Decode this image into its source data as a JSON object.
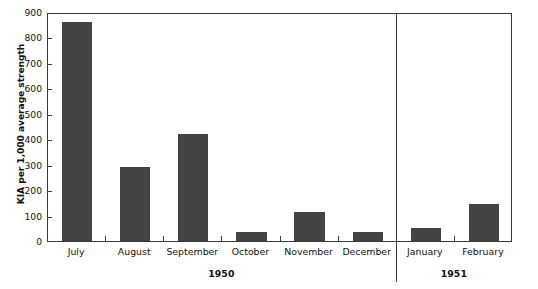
{
  "chart_data": {
    "type": "bar",
    "title": "",
    "subtitle": "",
    "xlabel": "",
    "ylabel": "KIA per 1,000 average strength",
    "ylim": [
      0,
      900
    ],
    "ytick_step": 100,
    "yticks": [
      "900",
      "800",
      "700",
      "600",
      "500",
      "400",
      "300",
      "200",
      "100",
      "0"
    ],
    "grid": false,
    "legend": null,
    "bar_color": "#434343",
    "axis_color": "#3a3a3a",
    "categories": [
      "July",
      "August",
      "September",
      "October",
      "November",
      "December",
      "January",
      "February"
    ],
    "values": [
      860,
      290,
      420,
      35,
      115,
      35,
      50,
      145
    ],
    "groups": [
      {
        "label": "1950",
        "categories": [
          "July",
          "August",
          "September",
          "October",
          "November",
          "December"
        ]
      },
      {
        "label": "1951",
        "categories": [
          "January",
          "February"
        ]
      }
    ],
    "annotations": []
  }
}
